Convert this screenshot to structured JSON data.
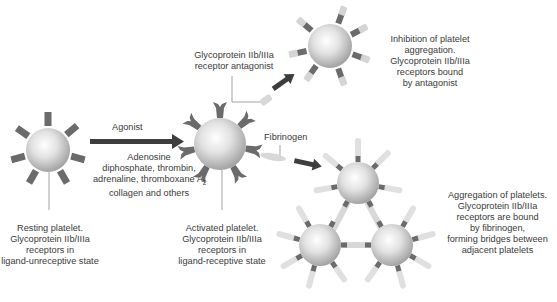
{
  "agonist": {
    "title": "Agonist",
    "lines": [
      "Adenosine",
      "diphosphate, thrombin,",
      "adrenaline, thromboxane A",
      "collagen and others"
    ],
    "subscript": "2"
  },
  "resting": {
    "lines": [
      "Resting platelet.",
      "Glycoprotein IIb/IIIa",
      "receptors in",
      "ligand-unreceptive state"
    ]
  },
  "activated": {
    "lines": [
      "Activated platelet.",
      "Glycoprotein IIb/IIIa",
      "receptors in",
      "ligand-receptive state"
    ]
  },
  "antagonist": {
    "lines": [
      "Glycoprotein IIb/IIIa",
      "receptor antagonist"
    ]
  },
  "inhibition": {
    "lines": [
      "Inhibition of platelet",
      "aggregation.",
      "Glycoprotein IIb/IIIa",
      "receptors bound",
      "by antagonist"
    ]
  },
  "fibrinogen": {
    "label": "Fibrinogen"
  },
  "aggregation": {
    "lines": [
      "Aggregation of platelets.",
      "Glycoprotein IIb/IIIa",
      "receptors are bound",
      "by fibrinogen,",
      "forming bridges between",
      "adjacent platelets"
    ]
  },
  "colors": {
    "arrow": "#3d3d3d",
    "receptor": "#6b6b6b",
    "ligand": "#d8d8d8",
    "leader_line": "#8a8a8a"
  }
}
